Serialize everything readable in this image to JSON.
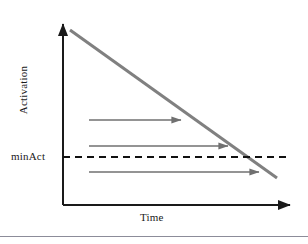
{
  "figure": {
    "background_color": "#ffffff",
    "bottom_rule_color": "#8c8c99"
  },
  "labels": {
    "y_axis_title": "Activation",
    "x_axis_title": "Time",
    "threshold_label": "minAct"
  },
  "colors": {
    "axis": "#1a1a1a",
    "decay_line": "#808080",
    "arrow": "#707070",
    "threshold_dash": "#111111",
    "text": "#1a1a1a"
  },
  "chart_data": {
    "type": "line",
    "title": "",
    "xlabel": "Time",
    "ylabel": "Activation",
    "grid": false,
    "legend": false,
    "axis_arrows": {
      "x_axis": {
        "from": [
          63,
          205
        ],
        "to": [
          292,
          205
        ],
        "arrowhead": "right"
      },
      "y_axis": {
        "from": [
          63,
          205
        ],
        "to": [
          63,
          22
        ],
        "arrowhead": "up"
      }
    },
    "series": [
      {
        "name": "activation decay",
        "style": "solid",
        "color": "#808080",
        "width": 3,
        "points": [
          [
            70,
            30
          ],
          [
            277,
            178
          ]
        ]
      }
    ],
    "threshold": {
      "name": "minAct",
      "style": "dashed",
      "color": "#111111",
      "y": 157,
      "x_start": 63,
      "x_end": 286
    },
    "annotations": [
      {
        "name": "duration-arrow-1",
        "y": 120,
        "x_start": 89,
        "x_end": 185,
        "crosses_decay_line": false
      },
      {
        "name": "duration-arrow-2",
        "y": 146,
        "x_start": 89,
        "x_end": 232,
        "crosses_decay_line": false
      },
      {
        "name": "duration-arrow-3",
        "y": 172,
        "x_start": 89,
        "x_end": 263,
        "crosses_decay_line": true
      }
    ]
  }
}
